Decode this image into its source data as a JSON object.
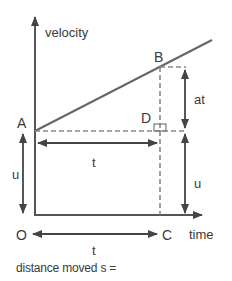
{
  "diagram": {
    "type": "velocity-time graph",
    "axes": {
      "y_label": "velocity",
      "x_label": "time",
      "origin_label": "O"
    },
    "points": {
      "A": "A",
      "B": "B",
      "C": "C",
      "D": "D"
    },
    "dimensions": {
      "at_label": "at",
      "u_right_label": "u",
      "u_left_label": "u",
      "t_upper_label": "t",
      "t_lower_label": "t"
    },
    "caption": "distance moved s =",
    "colors": {
      "line": "#555555",
      "dashed": "#888888",
      "text": "#3a3a3a"
    }
  }
}
